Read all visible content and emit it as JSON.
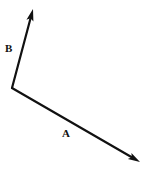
{
  "diagram": {
    "background_color": "#ffffff",
    "stroke_color": "#111111",
    "label_color": "#111111",
    "width": 147,
    "height": 170,
    "origin": {
      "x": 12,
      "y": 88
    },
    "vectors": [
      {
        "id": "A",
        "label": "A",
        "label_position": {
          "x": 62,
          "y": 128
        },
        "start": {
          "x": 12,
          "y": 88
        },
        "end": {
          "x": 140,
          "y": 162
        },
        "stroke_width": 2.2,
        "arrowhead": "solid-triangle",
        "direction": "down-right",
        "angle_deg": -30.0,
        "length_px": 147.8
      },
      {
        "id": "B",
        "label": "B",
        "label_position": {
          "x": 5,
          "y": 43
        },
        "start": {
          "x": 12,
          "y": 88
        },
        "end": {
          "x": 33,
          "y": 9
        },
        "stroke_width": 2.2,
        "arrowhead": "solid-triangle",
        "direction": "up-right",
        "angle_deg": 75.1,
        "length_px": 81.7
      }
    ]
  }
}
